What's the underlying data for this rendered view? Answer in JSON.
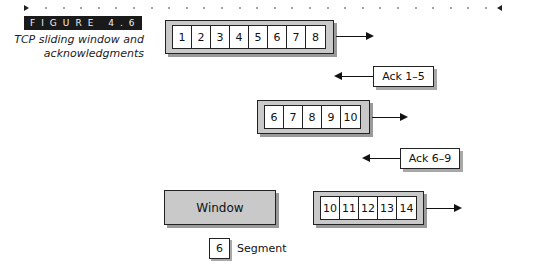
{
  "figure": {
    "label": "FIGURE 4.6",
    "caption_line1": "TCP sliding window and",
    "caption_line2": "acknowledgments"
  },
  "rows": [
    {
      "segments": [
        "1",
        "2",
        "3",
        "4",
        "5",
        "6",
        "7",
        "8"
      ],
      "direction": "send"
    },
    {
      "segments": [
        "6",
        "7",
        "8",
        "9",
        "10"
      ],
      "direction": "send"
    },
    {
      "segments": [
        "10",
        "11",
        "12",
        "13",
        "14"
      ],
      "direction": "send"
    }
  ],
  "acks": [
    {
      "label": "Ack 1–5"
    },
    {
      "label": "Ack 6–9"
    }
  ],
  "legend": {
    "window_label": "Window",
    "segment_example": "6",
    "segment_label": "Segment"
  },
  "colors": {
    "window_fill": "#c9c9c9",
    "shadow": "#9a9a9a",
    "label_bg": "#1a1a1a"
  }
}
